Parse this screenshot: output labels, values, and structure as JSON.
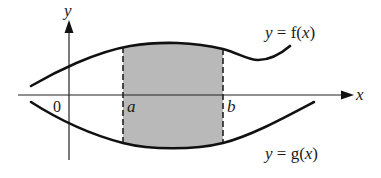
{
  "figure": {
    "axes": {
      "x_label": "x",
      "y_label": "y",
      "origin_label": "0"
    },
    "curves": [
      {
        "id": "upper",
        "label_var": "y",
        "label_eq": "=",
        "label_func": "f",
        "label_arg": "x",
        "label": "y = f(x)"
      },
      {
        "id": "lower",
        "label_var": "y",
        "label_eq": "=",
        "label_func": "g",
        "label_arg": "x",
        "label": "y = g(x)"
      }
    ],
    "bounds": {
      "left_label": "a",
      "right_label": "b"
    },
    "region": {
      "description": "shaded area between y = f(x) and y = g(x) from x = a to x = b",
      "fill_color": "#b9b9b9"
    },
    "colors": {
      "line": "#111111",
      "background": "#ffffff",
      "shade": "#b9b9b9"
    }
  }
}
